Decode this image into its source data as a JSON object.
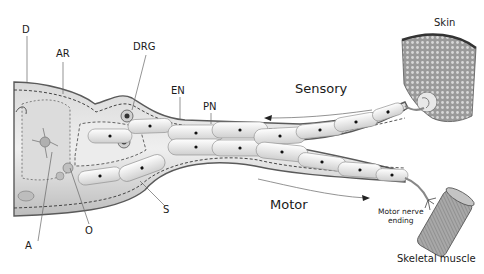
{
  "figure": {
    "type": "anatomical-diagram"
  },
  "labels": {
    "D": "D",
    "AR": "AR",
    "DRG": "DRG",
    "EN": "EN",
    "PN": "PN",
    "S": "S",
    "O": "O",
    "A": "A",
    "skin": "Skin",
    "sensory": "Sensory",
    "motor": "Motor",
    "motor_nerve_ending_line1": "Motor nerve",
    "motor_nerve_ending_line2": "ending",
    "skeletal_muscle": "Skeletal muscle"
  },
  "colors": {
    "tissue_light": "#e6e6e6",
    "tissue_mid": "#c8c8c8",
    "tissue_dark": "#8c8c8c",
    "outline": "#555555",
    "cell_fill": "#f2f2f2",
    "nucleus": "#111111",
    "skin_texture": "#7a7a7a",
    "muscle_fill": "#9a9a9a",
    "text": "#1a1a1a"
  }
}
